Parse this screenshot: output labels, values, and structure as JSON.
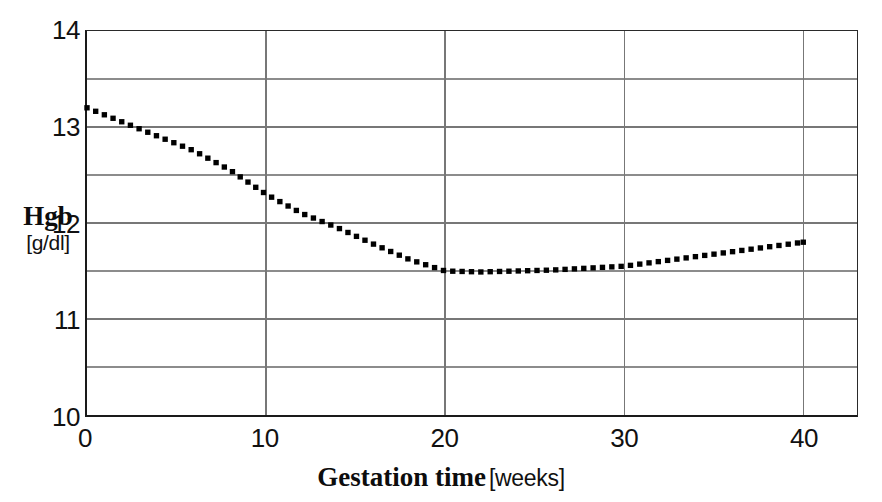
{
  "chart_data": {
    "type": "line",
    "title": "",
    "subtitle": "",
    "xlabel": "Gestation time",
    "xlabel_unit": "[weeks]",
    "ylabel": "Hgb",
    "ylabel_unit": "[g/dl]",
    "xlim": [
      0,
      43
    ],
    "ylim": [
      10,
      14
    ],
    "x_ticks": [
      0,
      10,
      20,
      30,
      40
    ],
    "x_tick_labels": [
      "0",
      "10",
      "20",
      "30",
      "40"
    ],
    "y_ticks": [
      10,
      11,
      12,
      13,
      14
    ],
    "y_tick_labels": [
      "10",
      "11",
      "12",
      "13",
      "14"
    ],
    "y_minor_ticks": [
      10.5,
      11.5,
      12.5,
      13.5
    ],
    "grid": true,
    "grid_color": "#777777",
    "legend": null,
    "legend_position": "none",
    "series": [
      {
        "name": "Hgb",
        "line_style": "dotted",
        "color": "#000000",
        "marker": "square",
        "x": [
          0,
          2,
          4,
          6,
          8,
          10,
          12,
          14,
          16,
          18,
          20,
          22,
          24,
          26,
          28,
          30,
          32,
          34,
          36,
          38,
          40
        ],
        "values": [
          13.2,
          13.05,
          12.9,
          12.75,
          12.55,
          12.3,
          12.1,
          11.95,
          11.78,
          11.62,
          11.5,
          11.49,
          11.5,
          11.51,
          11.53,
          11.55,
          11.6,
          11.65,
          11.7,
          11.75,
          11.8
        ]
      }
    ],
    "annotations": []
  },
  "axis": {
    "y_title_main": "Hgb",
    "y_title_unit": "[g/dl]",
    "x_title_main": "Gestation time",
    "x_title_unit": "[weeks]"
  }
}
